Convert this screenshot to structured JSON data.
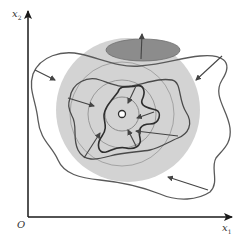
{
  "diagram": {
    "type": "level-set contraction / iterative convergence illustration",
    "axes": {
      "x_label": "x",
      "x_sub": "1",
      "y_label": "x",
      "y_sub": "2",
      "origin_label": "O"
    },
    "colors": {
      "background": "#ffffff",
      "large_disk": "#d3d3d3",
      "ellipse_fill": "#8c8c8c",
      "curve_stroke": "#555555",
      "inner_curve_stroke": "#333333",
      "circle_stroke": "#9a9a9a",
      "axis": "#1a1a1a"
    },
    "elements": [
      "large-shaded-disk",
      "dark-ellipse-top",
      "concentric-circles-3",
      "outer-wavy-contour",
      "middle-wavy-contour",
      "inner-wavy-contour",
      "center-point",
      "inward-arrows-10"
    ]
  }
}
